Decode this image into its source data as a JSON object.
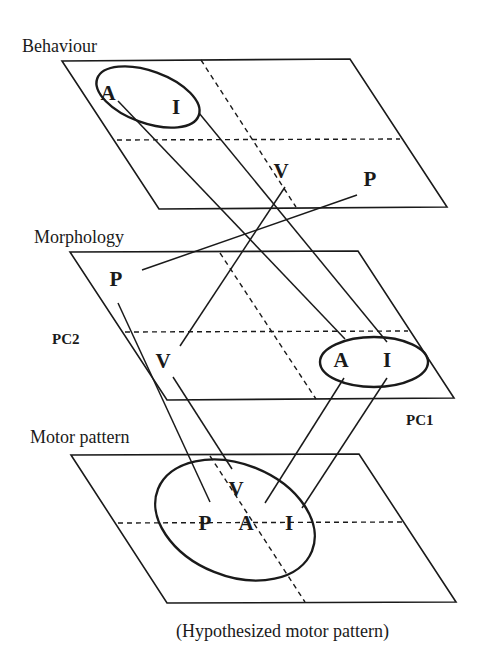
{
  "planes": [
    {
      "id": "behaviour",
      "title": "Behaviour",
      "title_pos": [
        22,
        52
      ],
      "corners": [
        [
          62,
          61
        ],
        [
          350,
          59
        ],
        [
          447,
          207
        ],
        [
          159,
          209
        ]
      ],
      "h_dash": [
        [
          117,
          140
        ],
        [
          400,
          139
        ]
      ],
      "d_dash": [
        [
          201,
          60
        ],
        [
          296,
          207
        ]
      ],
      "ellipse": {
        "cx": 148,
        "cy": 97,
        "rx": 54,
        "ry": 26,
        "rot": 20
      },
      "points": [
        {
          "label": "A",
          "x": 108,
          "y": 100
        },
        {
          "label": "I",
          "x": 176,
          "y": 114
        },
        {
          "label": "V",
          "x": 281,
          "y": 178
        },
        {
          "label": "P",
          "x": 370,
          "y": 186
        }
      ]
    },
    {
      "id": "morphology",
      "title": "Morphology",
      "title_pos": [
        34,
        243
      ],
      "corners": [
        [
          70,
          252
        ],
        [
          358,
          251
        ],
        [
          454,
          398
        ],
        [
          167,
          400
        ]
      ],
      "h_dash": [
        [
          125,
          332
        ],
        [
          408,
          331
        ]
      ],
      "d_dash": [
        [
          220,
          253
        ],
        [
          316,
          399
        ]
      ],
      "ellipse": {
        "cx": 374,
        "cy": 362,
        "rx": 54,
        "ry": 25,
        "rot": 0
      },
      "points": [
        {
          "label": "P",
          "x": 116,
          "y": 286
        },
        {
          "label": "V",
          "x": 163,
          "y": 368
        },
        {
          "label": "A",
          "x": 341,
          "y": 367
        },
        {
          "label": "I",
          "x": 387,
          "y": 367
        }
      ],
      "axis_labels": [
        {
          "label": "PC2",
          "x": 52,
          "y": 344
        },
        {
          "label": "PC1",
          "x": 406,
          "y": 425
        }
      ]
    },
    {
      "id": "motor-pattern",
      "title": "Motor pattern",
      "title_pos": [
        30,
        443
      ],
      "corners": [
        [
          71,
          455
        ],
        [
          359,
          454
        ],
        [
          456,
          602
        ],
        [
          167,
          603
        ]
      ],
      "h_dash": [
        [
          118,
          523
        ],
        [
          402,
          522
        ]
      ],
      "d_dash": [
        [
          210,
          456
        ],
        [
          305,
          602
        ]
      ],
      "ellipse": {
        "cx": 235,
        "cy": 520,
        "rx": 83,
        "ry": 56,
        "rot": 22
      },
      "points": [
        {
          "label": "V",
          "x": 236,
          "y": 496
        },
        {
          "label": "P",
          "x": 205,
          "y": 530
        },
        {
          "label": "A",
          "x": 246,
          "y": 530
        },
        {
          "label": "I",
          "x": 289,
          "y": 530
        }
      ],
      "caption": "(Hypothesized motor pattern)",
      "caption_pos": [
        176,
        637
      ]
    }
  ],
  "connections": [
    {
      "from": "behaviour.A",
      "to": "morphology.A",
      "line": [
        [
          118,
          101
        ],
        [
          345,
          339
        ]
      ]
    },
    {
      "from": "behaviour.I",
      "to": "morphology.I",
      "line": [
        [
          199,
          113
        ],
        [
          387,
          342
        ]
      ]
    },
    {
      "from": "behaviour.V",
      "to": "morphology.V",
      "line": [
        [
          285,
          187
        ],
        [
          180,
          346
        ]
      ]
    },
    {
      "from": "behaviour.P",
      "to": "morphology.P",
      "line": [
        [
          357,
          195
        ],
        [
          142,
          270
        ]
      ]
    },
    {
      "from": "morphology.P",
      "to": "motor-pattern.P",
      "line": [
        [
          118,
          303
        ],
        [
          210,
          502
        ]
      ]
    },
    {
      "from": "morphology.V",
      "to": "motor-pattern.V",
      "line": [
        [
          173,
          377
        ],
        [
          232,
          469
        ]
      ]
    },
    {
      "from": "morphology.A",
      "to": "motor-pattern.A",
      "line": [
        [
          344,
          378
        ],
        [
          265,
          503
        ]
      ]
    },
    {
      "from": "morphology.I",
      "to": "motor-pattern.I",
      "line": [
        [
          387,
          378
        ],
        [
          302,
          508
        ]
      ]
    }
  ]
}
